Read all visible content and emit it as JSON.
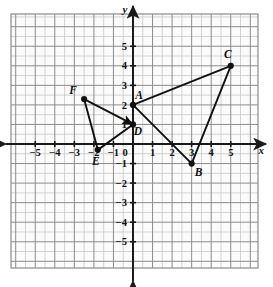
{
  "chart_data": {
    "type": "scatter",
    "title": "",
    "xlabel": "x",
    "ylabel": "y",
    "xlim": [
      -6.3,
      6.4
    ],
    "ylim": [
      -6.4,
      6.7
    ],
    "grid": true,
    "minor_grid": true,
    "legend": "none",
    "xticks": [
      "-5",
      "-4",
      "-3",
      "-2",
      "-1",
      "0",
      "1",
      "2",
      "3",
      "4",
      "5"
    ],
    "xtick_values": [
      -5,
      -4,
      -3,
      -2,
      -1,
      0,
      1,
      2,
      3,
      4,
      5
    ],
    "yticks": [
      "5",
      "4",
      "3",
      "2",
      "1",
      "-1",
      "-2",
      "-3",
      "-4",
      "-5"
    ],
    "ytick_values": [
      5,
      4,
      3,
      2,
      1,
      -1,
      -2,
      -3,
      -4,
      -5
    ],
    "origin_label": "0",
    "points": [
      {
        "name": "A",
        "x": 0,
        "y": 2,
        "label": "A",
        "label_dx": 6,
        "label_dy": -6
      },
      {
        "name": "B",
        "x": 3,
        "y": -1,
        "label": "B",
        "label_dx": 7,
        "label_dy": 12
      },
      {
        "name": "C",
        "x": 5,
        "y": 4,
        "label": "C",
        "label_dx": -3,
        "label_dy": -8
      },
      {
        "name": "D",
        "x": 0,
        "y": 1,
        "label": "D",
        "label_dx": 5,
        "label_dy": 11
      },
      {
        "name": "E",
        "x": -1.8,
        "y": -0.3,
        "label": "E",
        "label_dx": -2,
        "label_dy": 15
      },
      {
        "name": "F",
        "x": -2.5,
        "y": 2.3,
        "label": "F",
        "label_dx": -11,
        "label_dy": -5
      }
    ],
    "segments": [
      {
        "from": "A",
        "to": "C",
        "arrow": false
      },
      {
        "from": "C",
        "to": "B",
        "arrow": false
      },
      {
        "from": "B",
        "to": "A",
        "arrow": false
      },
      {
        "from": "F",
        "to": "D",
        "arrow": true
      },
      {
        "from": "D",
        "to": "E",
        "arrow": false
      },
      {
        "from": "E",
        "to": "F",
        "arrow": false
      }
    ],
    "shapes": [
      {
        "name": "triangle-abc",
        "vertices": [
          "A",
          "B",
          "C"
        ]
      },
      {
        "name": "triangle-def",
        "vertices": [
          "D",
          "E",
          "F"
        ]
      }
    ],
    "colors": {
      "grid_major": "#8c8c8c",
      "grid_minor": "#c8c8c8",
      "axis": "#1a1a1a",
      "ink": "#111111",
      "background": "#ffffff",
      "plot_background": "#fbfbfb"
    }
  }
}
